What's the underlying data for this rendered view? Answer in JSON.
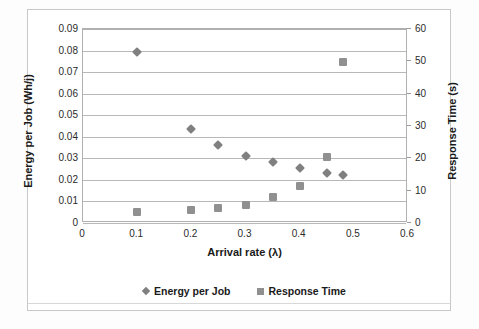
{
  "chart_data": {
    "type": "scatter",
    "title": "",
    "xlabel": "Arrival rate (λ)",
    "ylabel": "Energy per Job (Wh/j)",
    "y2label": "Response Time (s)",
    "xlim": [
      0,
      0.6
    ],
    "ylim": [
      0,
      0.09
    ],
    "y2lim": [
      0,
      60
    ],
    "xticks": [
      "0",
      "0.1",
      "0.2",
      "0.3",
      "0.4",
      "0.5",
      "0.6"
    ],
    "xtick_values": [
      0,
      0.1,
      0.2,
      0.3,
      0.4,
      0.5,
      0.6
    ],
    "yticks": [
      "0",
      "0.01",
      "0.02",
      "0.03",
      "0.04",
      "0.05",
      "0.06",
      "0.07",
      "0.08",
      "0.09"
    ],
    "ytick_values": [
      0,
      0.01,
      0.02,
      0.03,
      0.04,
      0.05,
      0.06,
      0.07,
      0.08,
      0.09
    ],
    "y2ticks": [
      "0",
      "10",
      "20",
      "30",
      "40",
      "50",
      "60"
    ],
    "y2tick_values": [
      0,
      10,
      20,
      30,
      40,
      50,
      60
    ],
    "grid": "horizontal",
    "legend_position": "bottom",
    "series": [
      {
        "name": "Energy per Job",
        "axis": "left",
        "marker": "diamond",
        "color": "#808080",
        "x": [
          0.1,
          0.2,
          0.25,
          0.3,
          0.35,
          0.4,
          0.45,
          0.48
        ],
        "values": [
          0.0795,
          0.0435,
          0.0362,
          0.0313,
          0.0283,
          0.0253,
          0.0233,
          0.0222
        ]
      },
      {
        "name": "Response Time",
        "axis": "right",
        "marker": "square",
        "color": "#909090",
        "x": [
          0.1,
          0.2,
          0.25,
          0.3,
          0.35,
          0.4,
          0.45,
          0.48
        ],
        "values": [
          3.5,
          4.0,
          4.5,
          5.5,
          8.0,
          11.5,
          20.5,
          49.8
        ]
      }
    ]
  },
  "legend": {
    "entries": [
      {
        "label": "Energy per Job",
        "marker": "diamond"
      },
      {
        "label": "Response Time",
        "marker": "square"
      }
    ]
  },
  "colors": {
    "energy_marker": "#808080",
    "response_marker": "#909090",
    "gridline": "#b8b8b8",
    "axis": "#b0b0b0",
    "text": "#1a1a1a"
  }
}
